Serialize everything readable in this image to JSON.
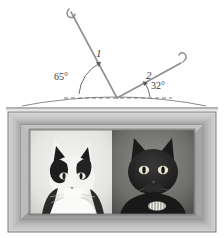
{
  "figure": {
    "type": "optics-ray-diagram-with-photo",
    "background_color": "#ffffff"
  },
  "diagram": {
    "labels": {
      "ray1": "1",
      "ray2": "2",
      "angle_left": "65°",
      "angle_right": "32°"
    },
    "elements": {
      "incident_ray_name": "ray-1",
      "reflected_ray_name": "ray-2",
      "normal_line_name": "horizontal-dashed-reference-line",
      "surface_name": "convex-mirror-surface"
    },
    "colors": {
      "ray_stroke": "#8a8a8a",
      "label_text": "#3a3a3a",
      "dashed_line": "#6e6e6e",
      "surface_stroke": "#7b7b7b",
      "arc_stroke": "#5a5a5a"
    },
    "geometry": {
      "vertex_x": 117,
      "vertex_y": 98,
      "ray1_tip_x": 70,
      "ray1_tip_y": 10,
      "ray2_tip_x": 182,
      "ray2_tip_y": 60,
      "baseline_y": 98,
      "angle_left_value": 65,
      "angle_right_value": 32
    }
  },
  "photo": {
    "frame_name": "picture-frame",
    "caption": "",
    "subjects": [
      {
        "name": "white-and-black-cat",
        "position": "left"
      },
      {
        "name": "black-cat",
        "position": "right"
      }
    ],
    "colors": {
      "frame_outer": "#b9b9b9",
      "frame_bevel_light": "#d7d7d7",
      "frame_bevel_dark": "#8f8f8f",
      "mat": "#a8a8a8",
      "photo_bg_left": "#e9e9e7",
      "photo_bg_right": "#6a6a68"
    },
    "bounds": {
      "x": 8,
      "y": 112,
      "width": 208,
      "height": 120
    }
  }
}
